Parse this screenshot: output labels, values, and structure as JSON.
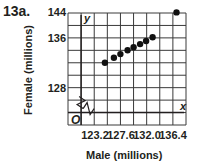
{
  "problem_label": "13a.",
  "chart_data": {
    "type": "scatter",
    "title": "",
    "xlabel": "Male (millions)",
    "ylabel": "Female (millions)",
    "x_ticks": [
      "123.2",
      "127.6",
      "132.0",
      "136.4"
    ],
    "y_ticks": [
      "128",
      "136",
      "144"
    ],
    "xlim": [
      118.8,
      138.6
    ],
    "ylim": [
      120,
      144
    ],
    "grid": true,
    "axis_break": true,
    "origin_label": "O",
    "x_axis_letter": "x",
    "y_axis_letter": "y",
    "points": [
      {
        "x": 125.0,
        "y": 128.0
      },
      {
        "x": 126.5,
        "y": 129.6
      },
      {
        "x": 127.6,
        "y": 130.8
      },
      {
        "x": 128.8,
        "y": 132.0
      },
      {
        "x": 129.8,
        "y": 133.0
      },
      {
        "x": 130.9,
        "y": 134.0
      },
      {
        "x": 131.9,
        "y": 135.0
      },
      {
        "x": 133.0,
        "y": 136.2
      },
      {
        "x": 137.0,
        "y": 144.2
      }
    ]
  }
}
